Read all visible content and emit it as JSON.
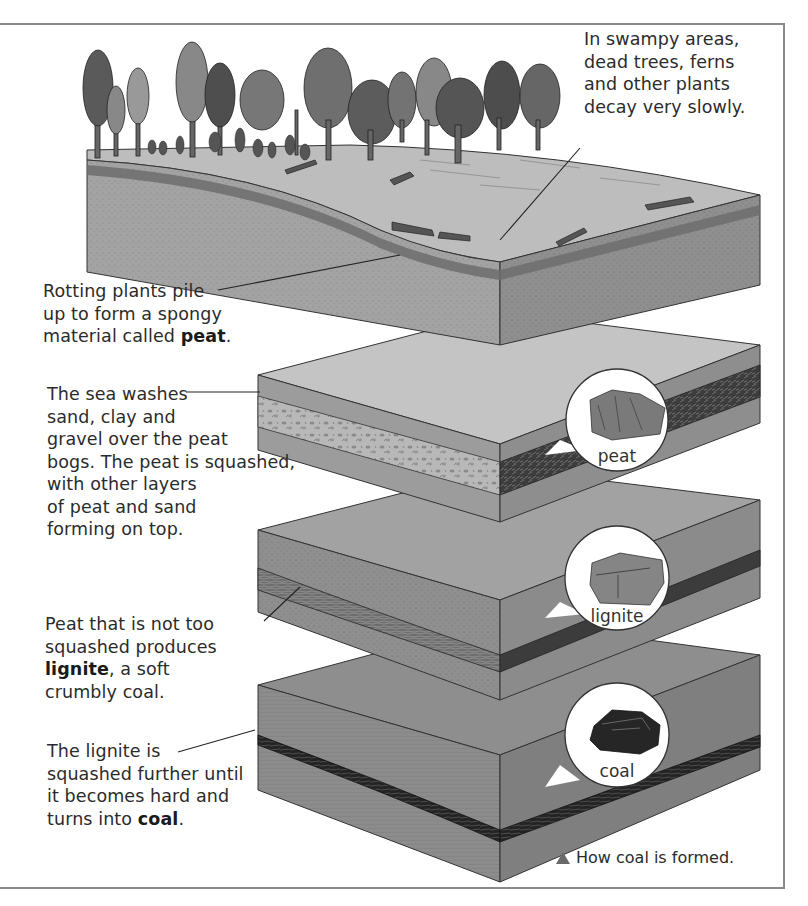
{
  "figure": {
    "caption": "How coal is formed.",
    "caption_marker": "triangle-up",
    "colors": {
      "frame": "#8a8a8a",
      "soil": "#9a9a9a",
      "sand_top": "#c9c9c9",
      "peat_dark": "#3a3a3a",
      "coal_dark": "#1e1e1e",
      "text": "#2b2b2b"
    }
  },
  "labels": {
    "swamp": {
      "lines": [
        "In swampy areas,",
        "dead trees, ferns",
        "and other plants",
        "decay very slowly."
      ]
    },
    "rotting": {
      "line1": "Rotting plants pile",
      "line2": "up to form a spongy",
      "line3_prefix": "material called ",
      "line3_bold": "peat",
      "line3_suffix": "."
    },
    "sea": {
      "lines": [
        "The sea washes",
        "sand, clay and",
        "gravel over the peat",
        "bogs. The peat is squashed,",
        "with other layers",
        "of peat and sand",
        "forming on top."
      ]
    },
    "lignite_text": {
      "line1": "Peat that is not too",
      "line2": "squashed produces",
      "line3_bold": "lignite",
      "line3_suffix": ", a soft",
      "line4": "crumbly coal."
    },
    "coal_text": {
      "line1": "The lignite is",
      "line2": "squashed further until",
      "line3": "it becomes hard and",
      "line4_prefix": "turns into ",
      "line4_bold": "coal",
      "line4_suffix": "."
    }
  },
  "stages": [
    {
      "name": "swamp-forest",
      "description": "Forest block with trees, ferns, and fallen logs"
    },
    {
      "name": "peat",
      "circle_label": "peat"
    },
    {
      "name": "lignite",
      "circle_label": "lignite"
    },
    {
      "name": "coal",
      "circle_label": "coal"
    }
  ]
}
